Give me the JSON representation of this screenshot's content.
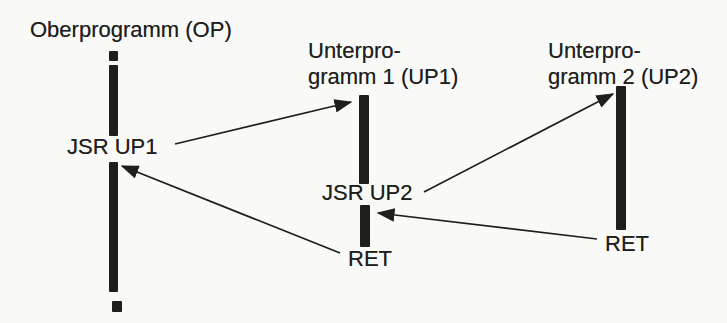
{
  "colors": {
    "ink": "#1e1e1c",
    "background": "#f9f9f7"
  },
  "programs": {
    "op": {
      "title": "Oberprogramm (OP)",
      "call_label": "JSR UP1"
    },
    "up1": {
      "title_line1": "Unterpro-",
      "title_line2": "gramm 1 (UP1)",
      "call_label": "JSR UP2",
      "return_label": "RET"
    },
    "up2": {
      "title_line1": "Unterpro-",
      "title_line2": "gramm 2 (UP2)",
      "return_label": "RET"
    }
  },
  "arrows": [
    {
      "id": "op-calls-up1",
      "from_label": "JSR UP1",
      "to_program": "UP1"
    },
    {
      "id": "up1-calls-up2",
      "from_label": "JSR UP2",
      "to_program": "UP2"
    },
    {
      "id": "up1-returns-to-op",
      "from_label": "RET",
      "to_program": "OP"
    },
    {
      "id": "up2-returns-to-up1",
      "from_label": "RET",
      "to_program": "UP1"
    }
  ]
}
